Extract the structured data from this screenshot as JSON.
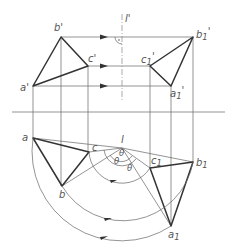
{
  "diagram": {
    "type": "orthographic-projection-rotation",
    "colors": {
      "line": "#333333",
      "thin": "#666666",
      "label": "#555555",
      "background": "#ffffff"
    },
    "labels": {
      "a_prime": "a'",
      "b_prime": "b'",
      "c_prime": "c'",
      "a1_prime": "a1'",
      "b1_prime": "b1'",
      "c1_prime": "c1'",
      "axis_prime": "l'",
      "a": "a",
      "b": "b",
      "c": "c",
      "a1": "a1",
      "b1": "b1",
      "c1": "c1",
      "axis": "l",
      "theta": "θ"
    },
    "points": {
      "front_view": {
        "a": [
          33,
          86
        ],
        "b": [
          61,
          37
        ],
        "c": [
          88,
          66
        ],
        "a1": [
          171,
          86
        ],
        "b1": [
          193,
          37
        ],
        "c1": [
          150,
          66
        ]
      },
      "top_view": {
        "a": [
          33,
          138
        ],
        "b": [
          62,
          186
        ],
        "c": [
          89,
          152
        ],
        "a1": [
          171,
          226
        ],
        "b1": [
          193,
          162
        ],
        "c1": [
          150,
          168
        ],
        "l": [
          122,
          148
        ]
      }
    }
  }
}
